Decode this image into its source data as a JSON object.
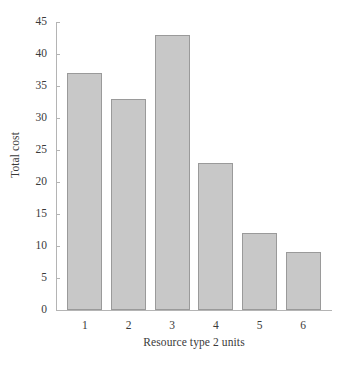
{
  "chart_data": {
    "type": "bar",
    "title": "",
    "subtitle": "",
    "xlabel": "Resource type 2 units",
    "ylabel": "Total cost",
    "categories": [
      "1",
      "2",
      "3",
      "4",
      "5",
      "6"
    ],
    "values": [
      37,
      33,
      43,
      23,
      12,
      9
    ],
    "series": [
      {
        "name": "Total cost",
        "values": [
          37,
          33,
          43,
          23,
          12,
          9
        ]
      }
    ],
    "ylim": [
      0,
      45
    ],
    "yticks": [
      0,
      5,
      10,
      15,
      20,
      25,
      30,
      35,
      40,
      45
    ],
    "ytick_labels": [
      "0",
      "5",
      "10",
      "15",
      "20",
      "25",
      "30",
      "35",
      "40",
      "45"
    ],
    "xtick_labels": [
      "1",
      "2",
      "3",
      "4",
      "5",
      "6"
    ],
    "grid": false,
    "legend": false,
    "legend_position": "none",
    "bar_color": "#c8c8c8",
    "bar_edge_color": "#9a9a9a",
    "axis_color": "#b4b4b4",
    "text_color": "#3a3a3a",
    "background_color": "#ffffff"
  }
}
